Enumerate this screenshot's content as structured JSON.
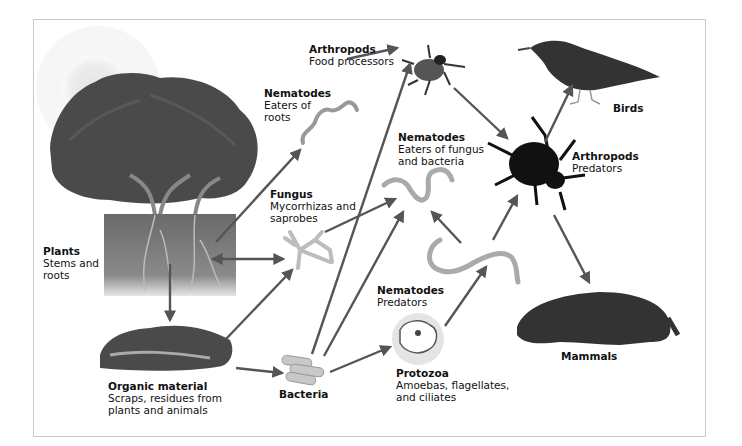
{
  "diagram": {
    "type": "soil food web",
    "colors": {
      "arrow": "#555555",
      "frame_border": "#c8c8c8",
      "background": "#ffffff"
    },
    "nodes": [
      {
        "id": "plants",
        "title": "Plants",
        "lines": [
          "Stems and",
          "roots"
        ]
      },
      {
        "id": "organic",
        "title": "Organic material",
        "lines": [
          "Scraps, residues from",
          "plants and animals"
        ]
      },
      {
        "id": "bacteria",
        "title": "Bacteria",
        "lines": []
      },
      {
        "id": "fungus",
        "title": "Fungus",
        "lines": [
          "Mycorrhizas and",
          "saprobes"
        ]
      },
      {
        "id": "nem_roots",
        "title": "Nematodes",
        "lines": [
          "Eaters of",
          "roots"
        ]
      },
      {
        "id": "nem_fb",
        "title": "Nematodes",
        "lines": [
          "Eaters of fungus",
          "and bacteria"
        ]
      },
      {
        "id": "nem_pred",
        "title": "Nematodes",
        "lines": [
          "Predators"
        ]
      },
      {
        "id": "protozoa",
        "title": "Protozoa",
        "lines": [
          "Amoebas, flagellates,",
          "and ciliates"
        ]
      },
      {
        "id": "arth_food",
        "title": "Arthropods",
        "lines": [
          "Food processors"
        ]
      },
      {
        "id": "arth_pred",
        "title": "Arthropods",
        "lines": [
          "Predators"
        ]
      },
      {
        "id": "birds",
        "title": "Birds",
        "lines": []
      },
      {
        "id": "mammals",
        "title": "Mammals",
        "lines": []
      }
    ],
    "edges": [
      [
        "plants",
        "nem_roots"
      ],
      [
        "plants",
        "fungus"
      ],
      [
        "fungus",
        "plants"
      ],
      [
        "plants",
        "organic"
      ],
      [
        "organic",
        "fungus"
      ],
      [
        "organic",
        "bacteria"
      ],
      [
        "fungus",
        "nem_fb"
      ],
      [
        "bacteria",
        "nem_fb"
      ],
      [
        "bacteria",
        "arth_food"
      ],
      [
        "bacteria",
        "protozoa"
      ],
      [
        "nem_roots",
        "arth_food"
      ],
      [
        "arth_food",
        "arth_pred"
      ],
      [
        "nem_pred",
        "nem_fb"
      ],
      [
        "protozoa",
        "nem_pred"
      ],
      [
        "nem_pred",
        "arth_pred"
      ],
      [
        "arth_pred",
        "birds"
      ],
      [
        "arth_pred",
        "mammals"
      ]
    ]
  },
  "labels": {
    "plants": {
      "title": "Plants",
      "l1": "Stems and",
      "l2": "roots"
    },
    "organic": {
      "title": "Organic material",
      "l1": "Scraps, residues from",
      "l2": "plants and animals"
    },
    "bacteria": {
      "title": "Bacteria"
    },
    "fungus": {
      "title": "Fungus",
      "l1": "Mycorrhizas and",
      "l2": "saprobes"
    },
    "nem_roots": {
      "title": "Nematodes",
      "l1": "Eaters of",
      "l2": "roots"
    },
    "nem_fb": {
      "title": "Nematodes",
      "l1": "Eaters of fungus",
      "l2": "and bacteria"
    },
    "nem_pred": {
      "title": "Nematodes",
      "l1": "Predators"
    },
    "protozoa": {
      "title": "Protozoa",
      "l1": "Amoebas, flagellates,",
      "l2": "and ciliates"
    },
    "arth_food": {
      "title": "Arthropods",
      "l1": "Food processors"
    },
    "arth_pred": {
      "title": "Arthropods",
      "l1": "Predators"
    },
    "birds": {
      "title": "Birds"
    },
    "mammals": {
      "title": "Mammals"
    }
  }
}
